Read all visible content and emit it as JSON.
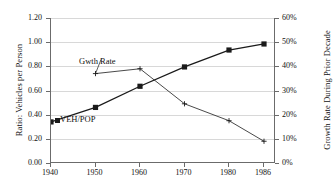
{
  "chart_data": {
    "type": "line",
    "title": "",
    "xlabel": "",
    "categories": [
      "1940",
      "1950",
      "1960",
      "1970",
      "1980",
      "1986"
    ],
    "x": [
      1940,
      1950,
      1960,
      1970,
      1980,
      1986
    ],
    "grid": true,
    "legend_position": "inline-annotations",
    "series": [
      {
        "name": "VEH/POP",
        "axis": "left",
        "marker": "filled-square",
        "values": [
          0.34,
          0.46,
          0.635,
          0.795,
          0.935,
          0.985
        ]
      },
      {
        "name": "Gwth Rate",
        "axis": "right",
        "marker": "plus",
        "values": [
          null,
          37,
          39,
          24.5,
          17.5,
          9
        ]
      }
    ],
    "left_axis": {
      "label": "Ratio: Vehicles per Person",
      "ylim": [
        0.0,
        1.2
      ],
      "ticks": [
        "0.00",
        "0.20",
        "0.40",
        "0.60",
        "0.80",
        "1.00",
        "1.20"
      ],
      "tick_values": [
        0.0,
        0.2,
        0.4,
        0.6,
        0.8,
        1.0,
        1.2
      ]
    },
    "right_axis": {
      "label": "Growth Rate During Prior Decade",
      "ylim": [
        0,
        60
      ],
      "ticks": [
        "0%",
        "10%",
        "20%",
        "30%",
        "40%",
        "50%",
        "60%"
      ],
      "tick_values": [
        0,
        10,
        20,
        30,
        40,
        50,
        60
      ]
    },
    "annotations": [
      {
        "text": "Gwth Rate",
        "series": "Gwth Rate"
      },
      {
        "text": "VEH/POP",
        "series": "VEH/POP"
      }
    ]
  },
  "colors": {
    "line": "#1a1a1a",
    "grid": "#d8d8d8",
    "axis": "#6b6b6b",
    "background": "#ffffff"
  }
}
